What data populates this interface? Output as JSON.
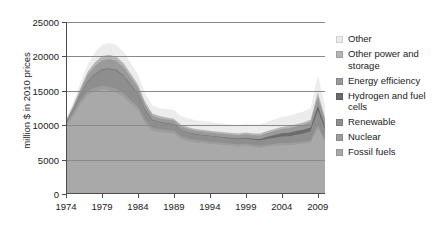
{
  "chart_data": {
    "type": "area",
    "stacked": true,
    "title": "",
    "xlabel": "",
    "ylabel": "million $ in 2010 prices",
    "xlim": [
      1974,
      2010
    ],
    "ylim": [
      0,
      25000
    ],
    "ytick_labels": [
      "0",
      "5000",
      "10000",
      "15000",
      "20000",
      "25000"
    ],
    "ytick_values": [
      0,
      5000,
      10000,
      15000,
      20000,
      25000
    ],
    "xtick_labels": [
      "1974",
      "1979",
      "1984",
      "1989",
      "1994",
      "1999",
      "2004",
      "2009"
    ],
    "xtick_values": [
      1974,
      1979,
      1984,
      1989,
      1994,
      1999,
      2004,
      2009
    ],
    "grid": "horizontal",
    "legend_position": "right",
    "x": [
      1974,
      1975,
      1976,
      1977,
      1978,
      1979,
      1980,
      1981,
      1982,
      1983,
      1984,
      1985,
      1986,
      1987,
      1988,
      1989,
      1990,
      1991,
      1992,
      1993,
      1994,
      1995,
      1996,
      1997,
      1998,
      1999,
      2000,
      2001,
      2002,
      2003,
      2004,
      2005,
      2006,
      2007,
      2008,
      2009,
      2010
    ],
    "series": [
      {
        "name": "Fossil fuels",
        "color": "#a9a9a9",
        "values": [
          9700,
          11300,
          13000,
          14400,
          14900,
          15200,
          15000,
          14700,
          14100,
          13100,
          12200,
          10300,
          9200,
          9000,
          8900,
          8800,
          8000,
          7700,
          7500,
          7400,
          7300,
          7200,
          7100,
          7000,
          6900,
          7000,
          6800,
          6700,
          6900,
          7000,
          7100,
          7100,
          7200,
          7300,
          7500,
          9600,
          7600
        ]
      },
      {
        "name": "Nuclear",
        "color": "#9d9d9d",
        "values": [
          400,
          450,
          500,
          520,
          540,
          560,
          560,
          550,
          540,
          520,
          500,
          460,
          430,
          420,
          410,
          400,
          380,
          370,
          360,
          350,
          340,
          330,
          330,
          320,
          320,
          310,
          310,
          300,
          300,
          300,
          300,
          300,
          300,
          310,
          320,
          420,
          330
        ]
      },
      {
        "name": "Renewable",
        "color": "#8e8e8e",
        "values": [
          250,
          500,
          900,
          1400,
          1900,
          2300,
          2600,
          2700,
          2500,
          2200,
          1800,
          1400,
          1100,
          1000,
          950,
          900,
          850,
          820,
          800,
          790,
          780,
          770,
          760,
          750,
          740,
          750,
          760,
          780,
          820,
          880,
          950,
          1000,
          1100,
          1200,
          1350,
          2100,
          1500
        ]
      },
      {
        "name": "Hydrogen and fuel cells",
        "color": "#6b6b6b",
        "values": [
          40,
          50,
          60,
          70,
          80,
          90,
          95,
          95,
          90,
          85,
          80,
          70,
          60,
          55,
          55,
          50,
          50,
          50,
          50,
          50,
          50,
          55,
          60,
          70,
          90,
          120,
          160,
          220,
          300,
          400,
          480,
          520,
          540,
          520,
          500,
          700,
          480
        ]
      },
      {
        "name": "Energy efficiency",
        "color": "#9a9a9a",
        "values": [
          180,
          350,
          600,
          900,
          1150,
          1300,
          1350,
          1300,
          1200,
          1050,
          900,
          750,
          600,
          550,
          530,
          520,
          500,
          490,
          480,
          480,
          470,
          470,
          470,
          470,
          480,
          490,
          500,
          520,
          550,
          580,
          620,
          650,
          680,
          720,
          780,
          1300,
          850
        ]
      },
      {
        "name": "Other power and storage",
        "color": "#b5b5b5",
        "values": [
          120,
          200,
          320,
          450,
          560,
          620,
          640,
          620,
          580,
          520,
          450,
          380,
          320,
          300,
          290,
          280,
          270,
          265,
          260,
          260,
          255,
          255,
          250,
          250,
          250,
          255,
          260,
          265,
          275,
          290,
          300,
          310,
          320,
          340,
          360,
          620,
          380
        ]
      },
      {
        "name": "Other",
        "color": "#ececec",
        "values": [
          300,
          500,
          800,
          1100,
          1400,
          1600,
          1700,
          1700,
          1650,
          1550,
          1450,
          1300,
          1150,
          1150,
          1200,
          1250,
          1300,
          1300,
          1280,
          1280,
          1260,
          1250,
          1250,
          1240,
          1250,
          1260,
          1280,
          1300,
          1350,
          1400,
          1450,
          1500,
          1550,
          1600,
          1700,
          2500,
          1800
        ]
      }
    ]
  },
  "legend": {
    "items": [
      {
        "label": "Other",
        "color": "#ececec"
      },
      {
        "label": "Other power and storage",
        "color": "#b5b5b5"
      },
      {
        "label": "Energy efficiency",
        "color": "#9a9a9a"
      },
      {
        "label": "Hydrogen and fuel cells",
        "color": "#6b6b6b"
      },
      {
        "label": "Renewable",
        "color": "#8e8e8e"
      },
      {
        "label": "Nuclear",
        "color": "#9d9d9d"
      },
      {
        "label": "Fossil fuels",
        "color": "#a9a9a9"
      }
    ]
  }
}
